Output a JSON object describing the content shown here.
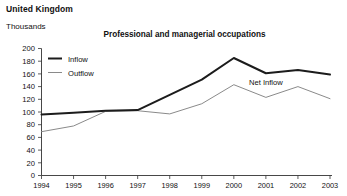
{
  "header": {
    "country": "United Kingdom",
    "units": "Thousands"
  },
  "chart_data": {
    "type": "line",
    "title": "Professional and managerial occupations",
    "xlabel": "",
    "ylabel": "Thousands",
    "categories": [
      "1994",
      "1995",
      "1996",
      "1997",
      "1998",
      "1999",
      "2000",
      "2001",
      "2002",
      "2003"
    ],
    "x": [
      1994,
      1995,
      1996,
      1997,
      1998,
      1999,
      2000,
      2001,
      2002,
      2003
    ],
    "series": [
      {
        "name": "Inflow",
        "color": "#1c1c1c",
        "values": [
          96,
          99,
          102,
          103,
          127,
          151,
          185,
          161,
          166,
          159
        ]
      },
      {
        "name": "Outflow",
        "color": "#8a8a8a",
        "values": [
          69,
          78,
          101,
          102,
          97,
          113,
          143,
          123,
          140,
          121
        ]
      }
    ],
    "ylim": [
      0,
      200
    ],
    "yticks": [
      0,
      20,
      40,
      60,
      80,
      100,
      120,
      140,
      160,
      180,
      200
    ],
    "ytick_labels": [
      "0",
      "20",
      "40",
      "60",
      "80",
      "100",
      "120",
      "140",
      "160",
      "180",
      "200"
    ],
    "grid": false,
    "legend": {
      "position": "top-left",
      "entries": [
        {
          "label": "Inflow"
        },
        {
          "label": "Outflow"
        }
      ]
    },
    "annotations": [
      {
        "text": "Net Inflow",
        "x": 2001,
        "y": 142
      }
    ]
  }
}
